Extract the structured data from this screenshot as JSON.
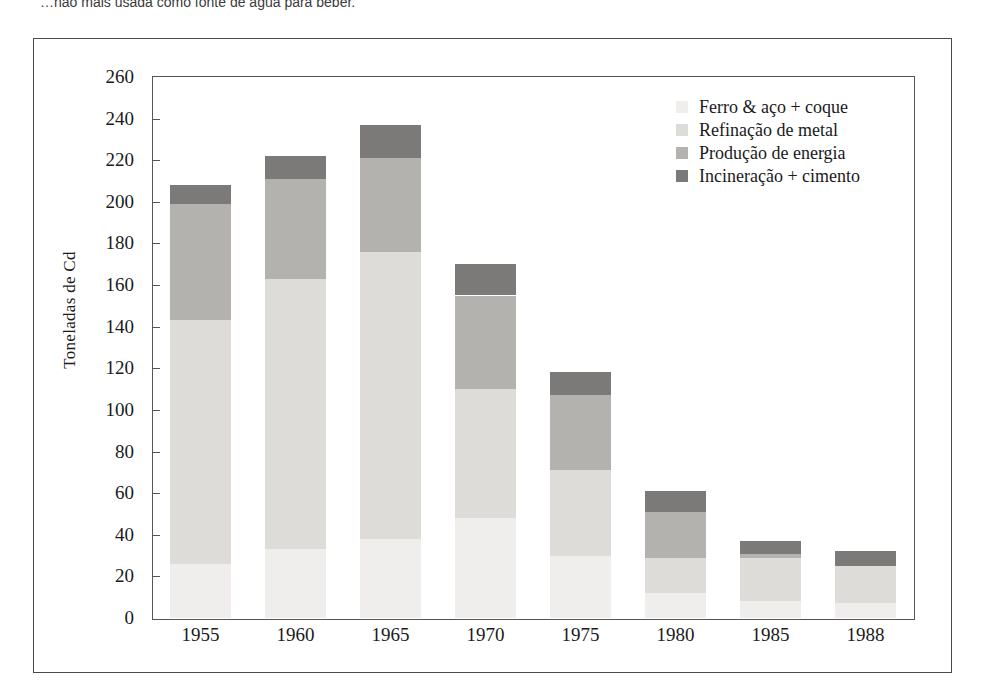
{
  "caption": "…não mais usada como fonte de água para beber.",
  "chart_data": {
    "type": "bar",
    "stacked": true,
    "title": "",
    "xlabel": "",
    "ylabel": "Toneladas de Cd",
    "ylim": [
      0,
      260
    ],
    "ytick_step": 20,
    "yticks": [
      0,
      20,
      40,
      60,
      80,
      100,
      120,
      140,
      160,
      180,
      200,
      220,
      240,
      260
    ],
    "grid": false,
    "legend_position": "top-right",
    "categories": [
      "1955",
      "1960",
      "1965",
      "1970",
      "1975",
      "1980",
      "1985",
      "1988"
    ],
    "series": [
      {
        "name": "Ferro & aço + coque",
        "color": "#efeeec",
        "values": [
          26,
          33,
          38,
          48,
          30,
          12,
          8,
          7
        ]
      },
      {
        "name": "Refinação de metal",
        "color": "#dedcd8",
        "values": [
          117,
          130,
          138,
          62,
          41,
          17,
          21,
          18
        ]
      },
      {
        "name": "Produção de energia",
        "color": "#b4b2ae",
        "values": [
          56,
          48,
          45,
          45,
          36,
          22,
          2,
          0
        ]
      },
      {
        "name": "Incineração + cimento",
        "color": "#7b7a78",
        "values": [
          9,
          11,
          16,
          15,
          11,
          10,
          6,
          7
        ]
      }
    ],
    "totals": [
      208,
      222,
      237,
      170,
      118,
      61,
      37,
      32
    ]
  }
}
